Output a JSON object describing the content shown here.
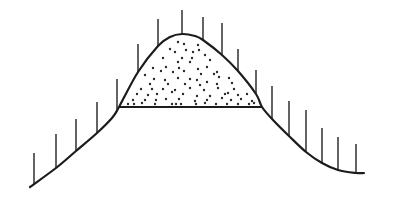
{
  "diagram": {
    "colors": {
      "background": "#ffffff",
      "ink": "#1c1c1c"
    },
    "curve_points": [
      [
        30,
        187
      ],
      [
        56,
        168
      ],
      [
        76,
        151
      ],
      [
        97,
        133
      ],
      [
        112,
        118
      ],
      [
        119,
        107
      ],
      [
        138,
        72
      ],
      [
        158,
        46
      ],
      [
        170,
        37
      ],
      [
        182,
        34
      ],
      [
        195,
        36
      ],
      [
        203,
        40
      ],
      [
        222,
        55
      ],
      [
        238,
        71
      ],
      [
        256,
        94
      ],
      [
        262,
        107
      ],
      [
        273,
        120
      ],
      [
        289,
        136
      ],
      [
        306,
        152
      ],
      [
        322,
        163
      ],
      [
        338,
        170
      ],
      [
        356,
        173
      ],
      [
        364,
        173
      ]
    ],
    "ticks": [
      {
        "x": 34,
        "top": 153,
        "bottom": 184
      },
      {
        "x": 56,
        "top": 134,
        "bottom": 168
      },
      {
        "x": 76,
        "top": 119,
        "bottom": 151
      },
      {
        "x": 97,
        "top": 102,
        "bottom": 133
      },
      {
        "x": 117,
        "top": 79,
        "bottom": 110
      },
      {
        "x": 138,
        "top": 44,
        "bottom": 72
      },
      {
        "x": 158,
        "top": 19,
        "bottom": 46
      },
      {
        "x": 182,
        "top": 10,
        "bottom": 34
      },
      {
        "x": 203,
        "top": 17,
        "bottom": 40
      },
      {
        "x": 222,
        "top": 23,
        "bottom": 55
      },
      {
        "x": 238,
        "top": 49,
        "bottom": 71
      },
      {
        "x": 256,
        "top": 70,
        "bottom": 94
      },
      {
        "x": 272,
        "top": 86,
        "bottom": 119
      },
      {
        "x": 289,
        "top": 101,
        "bottom": 136
      },
      {
        "x": 306,
        "top": 110,
        "bottom": 152
      },
      {
        "x": 322,
        "top": 128,
        "bottom": 163
      },
      {
        "x": 338,
        "top": 137,
        "bottom": 170
      },
      {
        "x": 356,
        "top": 144,
        "bottom": 173
      }
    ],
    "base_line": {
      "x1": 119,
      "y1": 107,
      "x2": 262,
      "y2": 107
    },
    "stipple_dots": [
      [
        178,
        42
      ],
      [
        184,
        44
      ],
      [
        198,
        45
      ],
      [
        170,
        49
      ],
      [
        186,
        50
      ],
      [
        175,
        52
      ],
      [
        193,
        52
      ],
      [
        199,
        50
      ],
      [
        205,
        55
      ],
      [
        163,
        58
      ],
      [
        182,
        58
      ],
      [
        192,
        58
      ],
      [
        210,
        60
      ],
      [
        178,
        62
      ],
      [
        190,
        62
      ],
      [
        153,
        68
      ],
      [
        166,
        67
      ],
      [
        179,
        68
      ],
      [
        198,
        69
      ],
      [
        207,
        67
      ],
      [
        217,
        72
      ],
      [
        161,
        71
      ],
      [
        173,
        72
      ],
      [
        184,
        71
      ],
      [
        201,
        74
      ],
      [
        214,
        74
      ],
      [
        219,
        77
      ],
      [
        145,
        75
      ],
      [
        154,
        79
      ],
      [
        165,
        80
      ],
      [
        178,
        78
      ],
      [
        190,
        79
      ],
      [
        197,
        80
      ],
      [
        207,
        82
      ],
      [
        229,
        78
      ],
      [
        150,
        84
      ],
      [
        168,
        84
      ],
      [
        185,
        84
      ],
      [
        200,
        85
      ],
      [
        217,
        84
      ],
      [
        232,
        83
      ],
      [
        141,
        89
      ],
      [
        152,
        89
      ],
      [
        163,
        89
      ],
      [
        175,
        90
      ],
      [
        190,
        88
      ],
      [
        204,
        90
      ],
      [
        218,
        88
      ],
      [
        234,
        89
      ],
      [
        228,
        93
      ],
      [
        137,
        94
      ],
      [
        148,
        95
      ],
      [
        157,
        94
      ],
      [
        172,
        92
      ],
      [
        183,
        94
      ],
      [
        197,
        96
      ],
      [
        210,
        96
      ],
      [
        225,
        94
      ],
      [
        238,
        95
      ],
      [
        247,
        94
      ],
      [
        133,
        100
      ],
      [
        145,
        100
      ],
      [
        156,
        100
      ],
      [
        166,
        99
      ],
      [
        179,
        99
      ],
      [
        195,
        101
      ],
      [
        207,
        100
      ],
      [
        222,
        98
      ],
      [
        231,
        100
      ],
      [
        241,
        99
      ],
      [
        252,
        101
      ],
      [
        128,
        104
      ],
      [
        134,
        104
      ],
      [
        142,
        103
      ],
      [
        155,
        104
      ],
      [
        172,
        104
      ],
      [
        176,
        104
      ],
      [
        181,
        104
      ],
      [
        196,
        104
      ],
      [
        205,
        103
      ],
      [
        216,
        104
      ],
      [
        227,
        104
      ],
      [
        238,
        104
      ],
      [
        249,
        104
      ],
      [
        254,
        103
      ]
    ]
  }
}
